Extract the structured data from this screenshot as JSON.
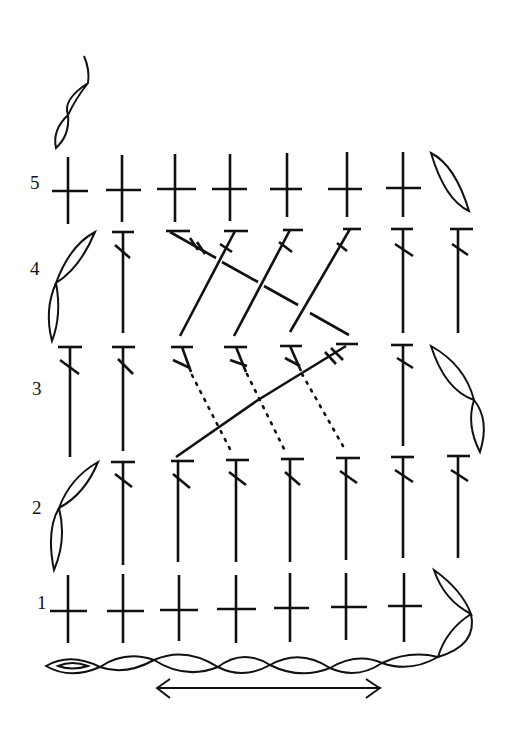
{
  "diagram": {
    "type": "crochet-stitch-chart",
    "ink_color": "#111111",
    "background": "#ffffff",
    "row_labels": [
      {
        "label": "5",
        "y": 186
      },
      {
        "label": "4",
        "y": 271
      },
      {
        "label": "3",
        "y": 390
      },
      {
        "label": "2",
        "y": 510
      },
      {
        "label": "1",
        "y": 604
      }
    ],
    "columns_x": [
      68,
      123,
      179,
      236,
      290,
      346,
      402,
      459
    ],
    "rows": [
      {
        "row": 1,
        "stitch": "single-crochet",
        "count": 7,
        "turning_chain": "2 chains, right"
      },
      {
        "row": 2,
        "stitch": "double-crochet",
        "count": 8,
        "turning_chain": "2 chains, left"
      },
      {
        "row": 3,
        "stitch": "double-crochet",
        "count": 8,
        "cable": "front-post cross, 3 over 1",
        "turning_chain": "2 chains, right"
      },
      {
        "row": 4,
        "stitch": "double-crochet",
        "count": 8,
        "cable": "back-post cross, 3 over 1",
        "turning_chain": "2 chains, left"
      },
      {
        "row": 5,
        "stitch": "single-crochet",
        "count": 7,
        "turning_chain": "1 chain, right"
      }
    ],
    "foundation_chain": {
      "count": 8,
      "start": "slip knot, left"
    },
    "repeat_arrow": {
      "x1": 157,
      "x2": 380,
      "y": 688,
      "meaning": "repeat section"
    }
  }
}
